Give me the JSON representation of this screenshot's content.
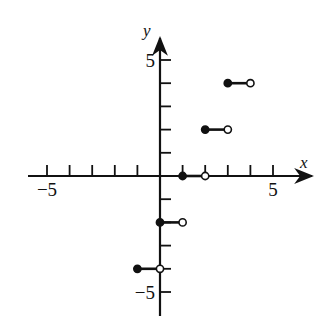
{
  "chart_data": {
    "type": "line",
    "subtype": "step-function",
    "title": "",
    "xlabel": "x",
    "ylabel": "y",
    "xlim": [
      -5.5,
      6.5
    ],
    "ylim": [
      -5.5,
      6
    ],
    "x_tick_labels": [
      {
        "value": -5,
        "label": "−5"
      },
      {
        "value": 5,
        "label": "5"
      }
    ],
    "y_tick_labels": [
      {
        "value": 5,
        "label": "5"
      },
      {
        "value": -5,
        "label": "−5"
      }
    ],
    "x_ticks": [
      -5,
      -4,
      -3,
      -2,
      -1,
      1,
      2,
      3,
      4,
      5
    ],
    "y_ticks": [
      5,
      4,
      3,
      2,
      1,
      -1,
      -2,
      -3,
      -4,
      -5
    ],
    "grid": false,
    "series": [
      {
        "name": "f(x) = 2⌊x⌋",
        "segments": [
          {
            "x_start": -1,
            "x_end": 0,
            "y": -4,
            "start_closed": true,
            "end_closed": false
          },
          {
            "x_start": 0,
            "x_end": 1,
            "y": -2,
            "start_closed": true,
            "end_closed": false
          },
          {
            "x_start": 1,
            "x_end": 2,
            "y": 0,
            "start_closed": true,
            "end_closed": false
          },
          {
            "x_start": 2,
            "x_end": 3,
            "y": 2,
            "start_closed": true,
            "end_closed": false
          },
          {
            "x_start": 3,
            "x_end": 4,
            "y": 4,
            "start_closed": true,
            "end_closed": false
          }
        ]
      }
    ]
  },
  "layout": {
    "origin_px": [
      160,
      176
    ],
    "unit_px_x": 22.6,
    "unit_px_y": 23.2,
    "axis_color": "#111111"
  }
}
